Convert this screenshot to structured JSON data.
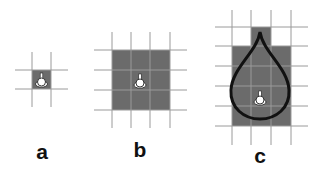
{
  "figure": {
    "panels": [
      {
        "id": "a",
        "label": "a",
        "grid": "4x4 lines",
        "highlighted_cells": 1,
        "marker": "pin-icon"
      },
      {
        "id": "b",
        "label": "b",
        "grid": "4x4 lines",
        "highlighted_cells": 9,
        "marker": "pin-icon"
      },
      {
        "id": "c",
        "label": "c",
        "grid": "4x6 lines",
        "highlighted_cells": 13,
        "marker": "pin-icon",
        "overlay": "teardrop-outline"
      }
    ],
    "colors": {
      "cell_fill": "#6b6b6b",
      "grid_line": "#9a9a9a",
      "outline": "#111111",
      "marker": "#ffffff"
    }
  }
}
